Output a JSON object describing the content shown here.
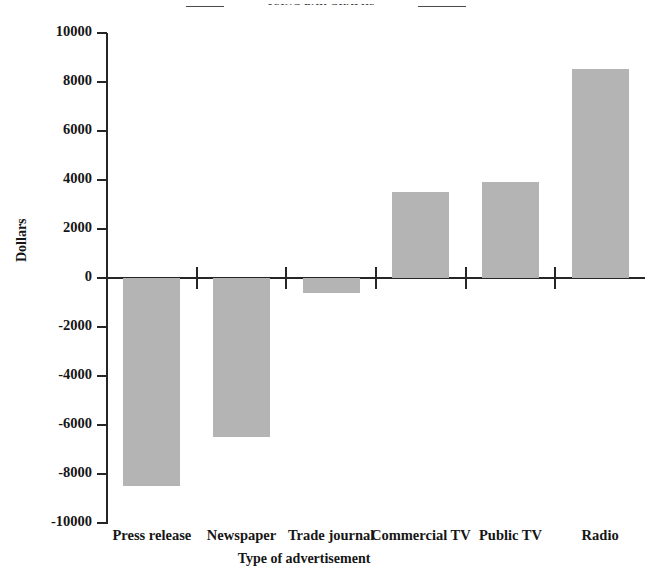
{
  "page": {
    "running_header": "USING BAR GRAPHS"
  },
  "chart_data": {
    "type": "bar",
    "title": "",
    "xlabel": "Type of advertisement",
    "ylabel": "Dollars",
    "categories": [
      "Press release",
      "Newspaper",
      "Trade journal",
      "Commercial TV",
      "Public TV",
      "Radio"
    ],
    "values": [
      -8500,
      -6500,
      -600,
      3500,
      3900,
      8550
    ],
    "ylim": [
      -10000,
      10000
    ],
    "yticks": [
      10000,
      8000,
      6000,
      4000,
      2000,
      0,
      -2000,
      -4000,
      -6000,
      -8000,
      -10000
    ],
    "ytick_labels": [
      "10000",
      "8000",
      "6000",
      "4000",
      "2000",
      "0",
      "-2000",
      "-4000",
      "-6000",
      "-8000",
      "-10000"
    ],
    "grid": false,
    "legend": null,
    "bar_color": "#b4b4b4",
    "axis_color": "#262626"
  }
}
